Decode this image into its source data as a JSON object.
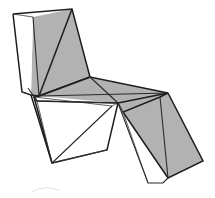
{
  "image": {
    "kind": "line-drawing",
    "subject": "faceted lounge chair",
    "background_color": "#ffffff",
    "canvas": {
      "width": 215,
      "height": 198
    }
  },
  "palette": {
    "panel_gray": "#b2b2b2",
    "panel_white": "#ffffff",
    "edge_dark": "#1d1d1d",
    "edge_mid": "#2a2a2a",
    "edge_hair": "#3a3a3a",
    "artifact_gray": "#e3e3e3"
  },
  "geometry": {
    "vertices": {
      "back_top_left": [
        13,
        14
      ],
      "back_top_apex": [
        72,
        9
      ],
      "back_crease_top": [
        33,
        17
      ],
      "back_left_foot": [
        31,
        95
      ],
      "back_gray_foot": [
        39,
        96
      ],
      "seat_left_junction": [
        34,
        97
      ],
      "seat_back_right": [
        90,
        77
      ],
      "seat_mid_node": [
        118,
        103
      ],
      "seat_right_tip": [
        168,
        93
      ],
      "seat_front_left": [
        37,
        101
      ],
      "seat_front_mid": [
        112,
        106
      ],
      "legrest_top": [
        160,
        97
      ],
      "legrest_bottom_right": [
        203,
        161
      ],
      "legrest_inner_low": [
        168,
        178
      ],
      "legrest_frame_bl": [
        163,
        183
      ],
      "legrest_frame_tl": [
        123,
        112
      ],
      "leg_front_foot": [
        52,
        163
      ],
      "leg_front_top": [
        95,
        108
      ],
      "leg_rear_lower": [
        107,
        150
      ],
      "leg_mid_lower": [
        148,
        183
      ]
    },
    "panels": [
      {
        "name": "backrest-gray-left",
        "fill": "#b2b2b2"
      },
      {
        "name": "backrest-gray-right",
        "fill": "#b2b2b2"
      },
      {
        "name": "backrest-white-strip",
        "fill": "#ffffff"
      },
      {
        "name": "seat-gray-rear",
        "fill": "#b2b2b2"
      },
      {
        "name": "seat-gray-right",
        "fill": "#b2b2b2"
      },
      {
        "name": "legrest-gray-upper",
        "fill": "#b2b2b2"
      },
      {
        "name": "legrest-gray-lower",
        "fill": "#b2b2b2"
      },
      {
        "name": "leg-white-front",
        "fill": "#ffffff"
      }
    ]
  }
}
